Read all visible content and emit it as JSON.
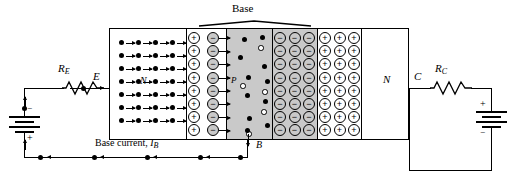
{
  "figure": {
    "type": "npn-transistor-band-diagram",
    "title_label": "Base",
    "regions": [
      {
        "name": "emitter",
        "label": "N",
        "type": "n-type",
        "fill": "#ffffff"
      },
      {
        "name": "emitter-depletion",
        "label": "",
        "type": "depletion",
        "fill": "#ffffff"
      },
      {
        "name": "base",
        "label": "P",
        "type": "p-type",
        "fill": "#c9c9c9"
      },
      {
        "name": "collector-depletion",
        "label": "",
        "type": "depletion",
        "fill": "#c9c9c9"
      },
      {
        "name": "collector",
        "label": "N",
        "type": "n-type",
        "fill": "#ffffff"
      }
    ]
  },
  "labels": {
    "base": "Base",
    "emitter_region": "N",
    "base_region": "P",
    "collector_region": "N",
    "emitter_terminal": "E",
    "base_terminal": "B",
    "collector_terminal": "C",
    "resistor_emitter": "R",
    "resistor_emitter_sub": "E",
    "resistor_collector": "R",
    "resistor_collector_sub": "C",
    "base_current": "Base current,",
    "base_current_symbol": "I",
    "base_current_sub": "B",
    "battery_left_top": "−",
    "battery_left_bottom": "+",
    "battery_right_top": "+",
    "battery_right_bottom": "−"
  },
  "charges": {
    "plus": "+",
    "minus": "−",
    "emitter_depletion_plus_cols": 1,
    "emitter_depletion_minus_cols": 1,
    "depletion_rows": 8,
    "collector_minus_cols": 3,
    "collector_plus_cols": 3,
    "collector_rows": 8
  },
  "carriers": {
    "electron_rows": 7,
    "electrons_per_row": 4,
    "base_electrons": 9,
    "base_holes": 5
  },
  "colors": {
    "line": "#000000",
    "gray_fill": "#c9c9c9",
    "white_fill": "#ffffff"
  }
}
